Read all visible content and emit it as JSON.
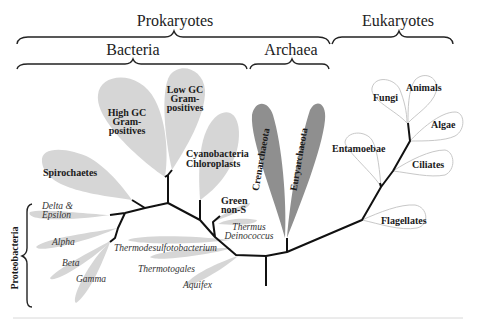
{
  "diagram": {
    "title_groups": {
      "prokaryotes": "Prokaryotes",
      "eukaryotes": "Eukaryotes",
      "bacteria": "Bacteria",
      "archaea": "Archaea",
      "proteobacteria": "Proteobacteria"
    },
    "bacteria": {
      "high_gc_1": "High GC",
      "high_gc_2": "Gram-",
      "high_gc_3": "positives",
      "low_gc_1": "Low GC",
      "low_gc_2": "Gram-",
      "low_gc_3": "positives",
      "spirochaetes": "Spirochaetes",
      "cyano_1": "Cyanobacteria",
      "cyano_2": "Chloroplasts",
      "green_1": "Green",
      "green_2": "non-S",
      "thermus_1": "Thermus",
      "thermus_2": "Deinococcus",
      "thermodesulfo": "Thermodesulfotobacterium",
      "thermotogales": "Thermotogales",
      "aquifex": "Aquifex",
      "delta_1": "Delta &",
      "delta_2": "Epsilon",
      "alpha": "Alpha",
      "beta": "Beta",
      "gamma": "Gamma"
    },
    "archaea": {
      "crenarchaeota": "Crenarchaeota",
      "euryarchaeota": "Euryarchaeota"
    },
    "eukaryotes": {
      "fungi": "Fungi",
      "animals": "Animals",
      "algae": "Algae",
      "ciliates": "Ciliates",
      "entamoebae": "Entamoebae",
      "flagellates": "Flagellates"
    },
    "colors": {
      "bacteria_leaf": "#d6d6d6",
      "archaea_leaf": "#8f8f8f",
      "eukaryote_outline": "#c8c8c8",
      "branch": "#111111"
    }
  }
}
